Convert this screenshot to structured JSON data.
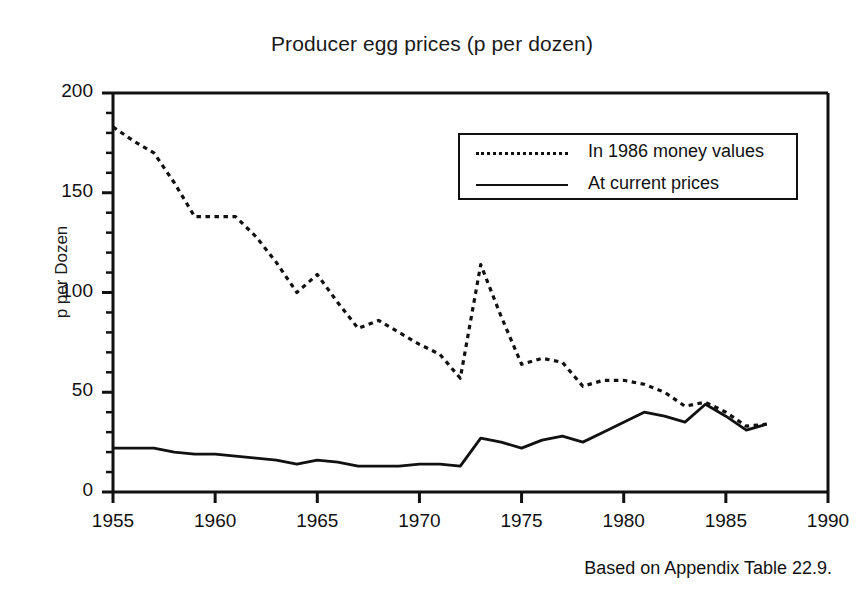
{
  "chart_data": {
    "type": "line",
    "title": "Producer egg prices (p per dozen)",
    "xlabel": "",
    "ylabel": "p per Dozen",
    "xlim": [
      1955,
      1990
    ],
    "ylim": [
      0,
      200
    ],
    "xticks": [
      "1955",
      "1960",
      "1965",
      "1970",
      "1975",
      "1980",
      "1985",
      "1990"
    ],
    "yticks": [
      "0",
      "50",
      "100",
      "150",
      "200"
    ],
    "xtick_values": [
      1955,
      1960,
      1965,
      1970,
      1975,
      1980,
      1985,
      1990
    ],
    "ytick_values": [
      0,
      50,
      100,
      150,
      200
    ],
    "minor_tick_step_y": 10,
    "minor_tick_step_x": 1,
    "grid": false,
    "legend_position": "upper right",
    "caption": "Based on Appendix Table 22.9.",
    "x": [
      1955,
      1956,
      1957,
      1958,
      1959,
      1960,
      1961,
      1962,
      1963,
      1964,
      1965,
      1966,
      1967,
      1968,
      1969,
      1970,
      1971,
      1972,
      1973,
      1974,
      1975,
      1976,
      1977,
      1978,
      1979,
      1980,
      1981,
      1982,
      1983,
      1984,
      1985,
      1986,
      1987
    ],
    "series": [
      {
        "name": "In 1986 money values",
        "style": "dotted",
        "color": "#111111",
        "values": [
          183,
          176,
          170,
          155,
          138,
          138,
          138,
          128,
          115,
          100,
          109,
          95,
          82,
          86,
          80,
          74,
          69,
          57,
          114,
          88,
          64,
          67,
          65,
          53,
          56,
          56,
          54,
          50,
          43,
          45,
          40,
          33,
          34
        ]
      },
      {
        "name": "At current prices",
        "style": "solid",
        "color": "#111111",
        "values": [
          22,
          22,
          22,
          20,
          19,
          19,
          18,
          17,
          16,
          14,
          16,
          15,
          13,
          13,
          13,
          14,
          14,
          13,
          27,
          25,
          22,
          26,
          28,
          25,
          30,
          35,
          40,
          38,
          35,
          44,
          38,
          31,
          34
        ]
      }
    ]
  },
  "legend": {
    "items": [
      {
        "label": "In 1986 money values",
        "style": "dotted"
      },
      {
        "label": "At current prices",
        "style": "solid"
      }
    ]
  }
}
